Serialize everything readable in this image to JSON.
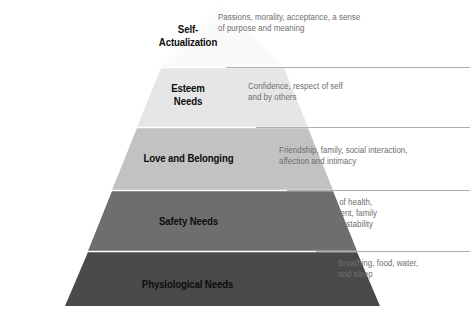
{
  "diagram": {
    "type": "pyramid",
    "name": "Maslow's Hierarchy of Needs",
    "tier_count": 5,
    "background_color": "#ffffff",
    "leader_line_color": "#9a9a9a",
    "label_color": "#0d0d0d",
    "description_color": "#6e6e6e"
  },
  "tiers": [
    {
      "index": 1,
      "position": "top",
      "label": "Self-\nActualization",
      "description": "Passions, morality, acceptance, a sense\nof purpose and meaning",
      "fill_color": "#fafafa"
    },
    {
      "index": 2,
      "position": "second",
      "label": "Esteem\nNeeds",
      "description": "Confidence, respect of self\nand by others",
      "fill_color": "#e6e6e6"
    },
    {
      "index": 3,
      "position": "middle",
      "label": "Love and Belonging",
      "description": "Friendship, family, social interaction,\naffection and intimacy",
      "fill_color": "#c2c2c2"
    },
    {
      "index": 4,
      "position": "fourth",
      "label": "Safety Needs",
      "description": "Security of health,\nemployment, family\nand social stability",
      "fill_color": "#6e6e6e"
    },
    {
      "index": 5,
      "position": "base",
      "label": "Physiological Needs",
      "description": "Breathing, food, water,\nand sleep",
      "fill_color": "#4a4a4a"
    }
  ]
}
